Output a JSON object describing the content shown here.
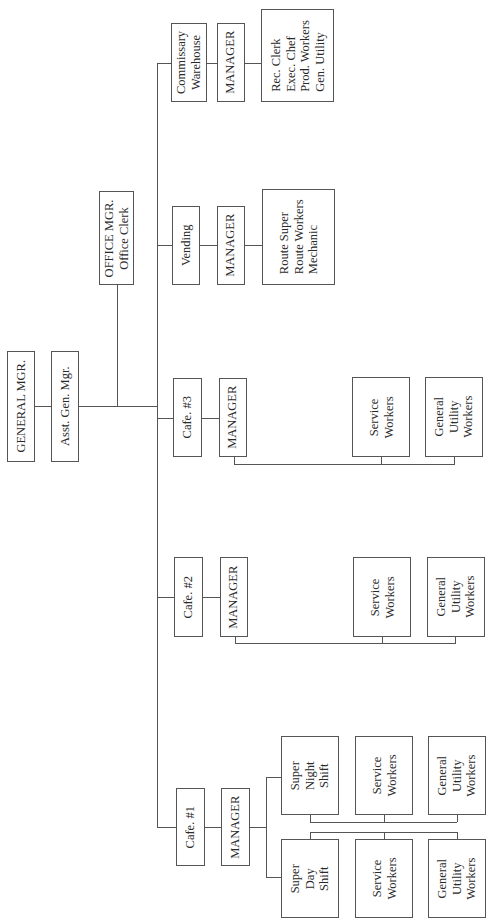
{
  "org_chart": {
    "general_manager": "GENERAL MGR.",
    "asst_general_manager": "Asst. Gen. Mgr.",
    "office_manager": "OFFICE MGR.\nOffice Clerk",
    "units": {
      "commissary": {
        "name": "Commissary\nWarehouse",
        "manager": "MANAGER",
        "staff": "Rec. Clerk\nExec. Chef\nProd. Workers\nGen. Utility"
      },
      "vending": {
        "name": "Vending",
        "manager": "MANAGER",
        "staff": "Route Super\nRoute Workers\nMechanic"
      },
      "cafe3": {
        "name": "Cafe. #3",
        "manager": "MANAGER",
        "service": "Service\nWorkers",
        "utility": "General\nUtility\nWorkers"
      },
      "cafe2": {
        "name": "Cafe. #2",
        "manager": "MANAGER",
        "service": "Service\nWorkers",
        "utility": "General\nUtility\nWorkers"
      },
      "cafe1": {
        "name": "Cafe. #1",
        "manager": "MANAGER",
        "night_super": "Super\nNight\nShift",
        "night_service": "Service\nWorkers",
        "night_utility": "General\nUtility\nWorkers",
        "day_super": "Super\nDay\nShift",
        "day_service": "Service\nWorkers",
        "day_utility": "General\nUtility\nWorkers"
      }
    }
  }
}
